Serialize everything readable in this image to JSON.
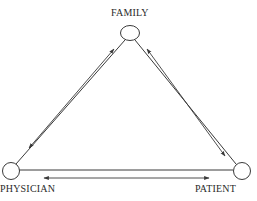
{
  "diagram": {
    "type": "triangle-relationship",
    "nodes": [
      {
        "id": "family",
        "label": "FAMILY",
        "position": "top"
      },
      {
        "id": "physician",
        "label": "PHYSICIAN",
        "position": "bottom-left"
      },
      {
        "id": "patient",
        "label": "PATIENT",
        "position": "bottom-right"
      }
    ],
    "edges": [
      {
        "from": "family",
        "to": "physician",
        "style": "line-with-bidirectional-arrow"
      },
      {
        "from": "family",
        "to": "patient",
        "style": "line-with-bidirectional-arrow"
      },
      {
        "from": "physician",
        "to": "patient",
        "style": "line-with-bidirectional-arrow"
      }
    ],
    "colors": {
      "stroke": "#3a3a3a",
      "background": "#ffffff"
    }
  }
}
